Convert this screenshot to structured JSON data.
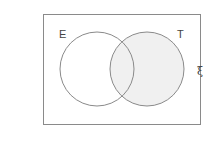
{
  "diagram": {
    "type": "venn",
    "universal_symbol": "ξ",
    "sets": [
      {
        "label": "E",
        "shaded": false
      },
      {
        "label": "T",
        "shaded": true
      }
    ],
    "colors": {
      "stroke": "#8a8a8a",
      "shade": "#f0f0f0",
      "text": "#444444"
    }
  }
}
